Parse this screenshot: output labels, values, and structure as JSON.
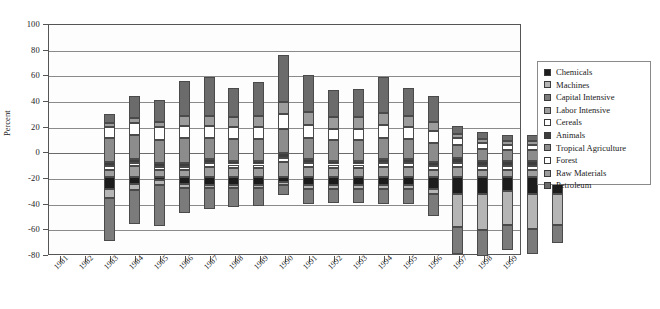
{
  "chart_data": {
    "type": "bar",
    "subtype": "stacked-diverging",
    "title": "",
    "xlabel": "",
    "ylabel": "Percent",
    "ylim": [
      -80,
      100
    ],
    "yticks": [
      100,
      80,
      60,
      40,
      20,
      0,
      -20,
      -40,
      -60,
      -80
    ],
    "grid": true,
    "legend_position": "right-outside",
    "categories": [
      "1981",
      "1982",
      "1983",
      "1984",
      "1985",
      "1986",
      "1987",
      "1988",
      "1989",
      "1990",
      "1991",
      "1992",
      "1993",
      "1994",
      "1995",
      "1996",
      "1997",
      "1998",
      "1999"
    ],
    "series": [
      {
        "name": "Chemicals",
        "color": "#1c1c1c",
        "values": [
          -9,
          -5,
          -2,
          -5,
          -6,
          -6,
          -6,
          -4,
          -6,
          -6,
          -6,
          -6,
          -6,
          -9,
          -13,
          -13,
          -11,
          -13,
          -13
        ]
      },
      {
        "name": "Machines",
        "color": "#b5b5b5",
        "values": [
          -7,
          -5,
          -4,
          -3,
          -2,
          -2,
          -2,
          -2,
          -3,
          -3,
          -3,
          -3,
          -3,
          -4,
          -26,
          -28,
          -26,
          -27,
          -24
        ]
      },
      {
        "name": "Capital Intensive",
        "color": "#7b7b7b",
        "values": [
          -34,
          -26,
          -32,
          -20,
          -17,
          -15,
          -14,
          -8,
          -12,
          -11,
          -11,
          -12,
          -12,
          -17,
          -21,
          -20,
          -20,
          -20,
          -14
        ]
      },
      {
        "name": "Labor Intensive",
        "color": "#9e9e9e",
        "values": [
          6,
          9,
          6,
          6,
          8,
          7,
          7,
          12,
          8,
          7,
          7,
          8,
          8,
          6,
          8,
          6,
          6,
          6,
          7
        ]
      },
      {
        "name": "Cereals",
        "color": "#ffffff",
        "values": [
          3,
          2,
          2,
          2,
          3,
          3,
          3,
          3,
          3,
          3,
          3,
          3,
          3,
          3,
          3,
          3,
          3,
          3,
          3
        ]
      },
      {
        "name": "Animals",
        "color": "#3d3d3d",
        "values": [
          3,
          3,
          3,
          3,
          3,
          3,
          3,
          4,
          3,
          3,
          3,
          3,
          3,
          3,
          4,
          4,
          4,
          4,
          4
        ]
      },
      {
        "name": "Tropical Agriculture",
        "color": "#8c8c8c",
        "values": [
          19,
          19,
          18,
          20,
          17,
          17,
          17,
          19,
          17,
          16,
          16,
          17,
          16,
          15,
          10,
          9,
          8,
          8,
          10
        ]
      },
      {
        "name": "Forest",
        "color": "#ffffff",
        "values": [
          8,
          9,
          10,
          9,
          9,
          9,
          9,
          11,
          10,
          9,
          9,
          10,
          9,
          9,
          6,
          5,
          4,
          4,
          5
        ]
      },
      {
        "name": "Raw Materials",
        "color": "#9c9c9c",
        "values": [
          3,
          4,
          4,
          8,
          8,
          8,
          9,
          10,
          10,
          9,
          9,
          9,
          9,
          7,
          3,
          3,
          3,
          3,
          3
        ]
      },
      {
        "name": "Petroleum",
        "color": "#6b6b6b",
        "values": [
          7,
          17,
          17,
          27,
          30,
          23,
          26,
          36,
          29,
          21,
          22,
          28,
          22,
          20,
          6,
          5,
          5,
          5,
          9
        ]
      }
    ],
    "totals_positive": [
      49,
      63,
      60,
      75,
      78,
      70,
      74,
      95,
      80,
      68,
      69,
      78,
      70,
      63,
      40,
      35,
      33,
      33,
      41
    ],
    "totals_negative": [
      -50,
      -36,
      -38,
      -28,
      -25,
      -23,
      -22,
      -14,
      -21,
      -20,
      -20,
      -21,
      -21,
      -30,
      -60,
      -61,
      -57,
      -60,
      -51
    ]
  },
  "axis": {
    "ylabel": "Percent",
    "yticks": [
      "100",
      "80",
      "60",
      "40",
      "20",
      "0",
      "-20",
      "-40",
      "-60",
      "-80"
    ],
    "xticks": [
      "1981",
      "1982",
      "1983",
      "1984",
      "1985",
      "1986",
      "1987",
      "1988",
      "1989",
      "1990",
      "1991",
      "1992",
      "1993",
      "1994",
      "1995",
      "1996",
      "1997",
      "1998",
      "1999"
    ]
  },
  "legend": {
    "items": [
      {
        "label": "Chemicals",
        "color": "#1c1c1c"
      },
      {
        "label": "Machines",
        "color": "#b5b5b5"
      },
      {
        "label": "Capital Intensive",
        "color": "#7b7b7b"
      },
      {
        "label": "Labor Intensive",
        "color": "#9e9e9e"
      },
      {
        "label": "Cereals",
        "color": "#ffffff"
      },
      {
        "label": "Animals",
        "color": "#3d3d3d"
      },
      {
        "label": "Tropical Agriculture",
        "color": "#8c8c8c"
      },
      {
        "label": "Forest",
        "color": "#ffffff"
      },
      {
        "label": "Raw Materials",
        "color": "#9c9c9c"
      },
      {
        "label": "Petroleum",
        "color": "#6b6b6b"
      }
    ]
  }
}
